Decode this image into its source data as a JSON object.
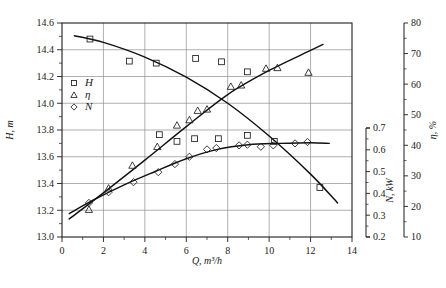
{
  "chart_data": {
    "type": "scatter",
    "title": "",
    "xlabel": "Q, m³/h",
    "ylabel": "H, m",
    "xlim": [
      0,
      14
    ],
    "xticks": [
      0,
      2,
      4,
      6,
      8,
      10,
      12,
      14
    ],
    "xtick_labels": [
      "0",
      "2",
      "4",
      "6",
      "8",
      "10",
      "12",
      "14"
    ],
    "x_minor_step": 1,
    "grid": true,
    "legend_position": "upper-left-inside",
    "axes": [
      {
        "id": "H",
        "label": "H, m",
        "unit": "m",
        "side": "left",
        "lim": [
          13.0,
          14.6
        ],
        "ticks": [
          13.0,
          13.2,
          13.4,
          13.6,
          13.8,
          14.0,
          14.2,
          14.4,
          14.6
        ],
        "tick_labels": [
          "13.0",
          "13.2",
          "13.4",
          "13.6",
          "13.8",
          "14.0",
          "14.2",
          "14.4",
          "14.6"
        ]
      },
      {
        "id": "N",
        "label": "N, kW",
        "unit": "kW",
        "side": "right-inner",
        "lim": [
          0.2,
          0.7
        ],
        "ticks": [
          0.2,
          0.3,
          0.4,
          0.5,
          0.6,
          0.7
        ],
        "tick_labels": [
          "0.2",
          "0.3",
          "0.4",
          "0.5",
          "0.6",
          "0.7"
        ]
      },
      {
        "id": "eta",
        "label": "η, %",
        "unit": "%",
        "side": "right-outer",
        "lim": [
          10,
          80
        ],
        "ticks": [
          10,
          20,
          30,
          40,
          50,
          60,
          70,
          80
        ],
        "tick_labels": [
          "10",
          "20",
          "30",
          "40",
          "50",
          "60",
          "70",
          "80"
        ]
      }
    ],
    "legend": [
      {
        "marker": "square",
        "label": "H",
        "axis": "H"
      },
      {
        "marker": "triangle",
        "label": "η",
        "axis": "eta"
      },
      {
        "marker": "diamond",
        "label": "N",
        "axis": "N"
      }
    ],
    "series": [
      {
        "name": "H",
        "symbol": "square",
        "axis": "H",
        "points": [
          [
            1.35,
            14.48
          ],
          [
            3.25,
            14.315
          ],
          [
            4.55,
            14.3
          ],
          [
            6.45,
            14.335
          ],
          [
            7.7,
            14.31
          ],
          [
            8.95,
            14.235
          ],
          [
            4.7,
            13.765
          ],
          [
            5.55,
            13.715
          ],
          [
            6.4,
            13.735
          ],
          [
            7.55,
            13.735
          ],
          [
            8.95,
            13.76
          ],
          [
            10.25,
            13.715
          ],
          [
            12.45,
            13.37
          ]
        ],
        "fit_curve": [
          [
            0.6,
            14.505
          ],
          [
            2.0,
            14.455
          ],
          [
            4.0,
            14.345
          ],
          [
            6.0,
            14.195
          ],
          [
            8.0,
            14.0
          ],
          [
            10.0,
            13.755
          ],
          [
            12.0,
            13.47
          ],
          [
            13.3,
            13.255
          ]
        ]
      },
      {
        "name": "η",
        "symbol": "triangle",
        "axis": "eta",
        "points": [
          [
            1.3,
            13.205
          ],
          [
            2.25,
            13.365
          ],
          [
            3.4,
            13.535
          ],
          [
            4.6,
            13.675
          ],
          [
            5.55,
            13.835
          ],
          [
            6.15,
            13.875
          ],
          [
            6.55,
            13.945
          ],
          [
            7.0,
            13.955
          ],
          [
            8.15,
            14.125
          ],
          [
            8.65,
            14.135
          ],
          [
            9.85,
            14.26
          ],
          [
            10.4,
            14.265
          ],
          [
            11.9,
            14.23
          ]
        ],
        "fit_curve": [
          [
            0.35,
            13.135
          ],
          [
            2.0,
            13.33
          ],
          [
            4.0,
            13.575
          ],
          [
            6.0,
            13.825
          ],
          [
            8.0,
            14.065
          ],
          [
            10.0,
            14.245
          ],
          [
            12.0,
            14.395
          ],
          [
            12.6,
            14.44
          ]
        ]
      },
      {
        "name": "N",
        "symbol": "diamond",
        "axis": "N",
        "points": [
          [
            1.3,
            13.255
          ],
          [
            2.25,
            13.335
          ],
          [
            3.45,
            13.41
          ],
          [
            4.65,
            13.485
          ],
          [
            5.45,
            13.545
          ],
          [
            6.15,
            13.6
          ],
          [
            7.0,
            13.655
          ],
          [
            7.45,
            13.665
          ],
          [
            8.55,
            13.685
          ],
          [
            8.95,
            13.69
          ],
          [
            9.6,
            13.675
          ],
          [
            10.2,
            13.685
          ],
          [
            11.25,
            13.7
          ],
          [
            11.85,
            13.71
          ]
        ],
        "fit_curve": [
          [
            0.35,
            13.175
          ],
          [
            1.5,
            13.275
          ],
          [
            3.0,
            13.39
          ],
          [
            4.5,
            13.49
          ],
          [
            6.0,
            13.585
          ],
          [
            7.5,
            13.655
          ],
          [
            9.0,
            13.69
          ],
          [
            10.5,
            13.7
          ],
          [
            12.0,
            13.705
          ],
          [
            12.9,
            13.7
          ]
        ]
      }
    ],
    "caption": ""
  }
}
